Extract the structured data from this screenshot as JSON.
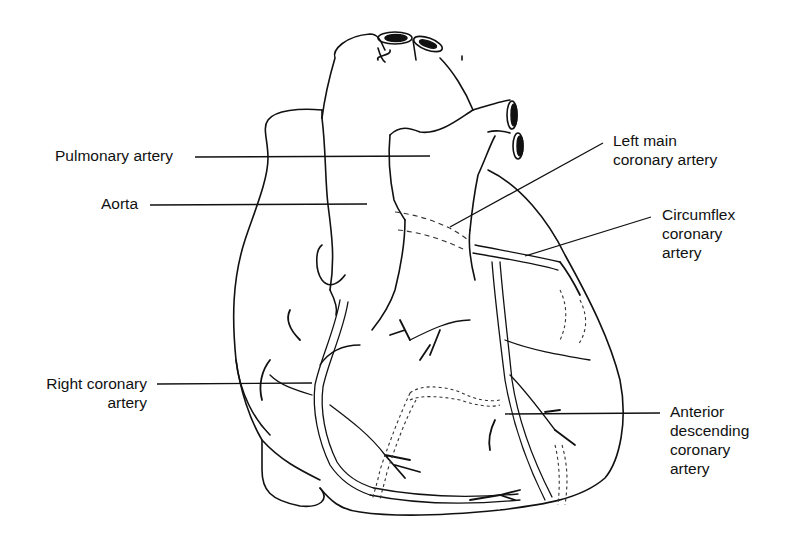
{
  "diagram": {
    "labels": [
      {
        "id": "pulmonary-artery",
        "lines": [
          "Pulmonary artery"
        ]
      },
      {
        "id": "aorta",
        "lines": [
          "Aorta"
        ]
      },
      {
        "id": "left-main-coronary-artery",
        "lines": [
          "Left main",
          "coronary artery"
        ]
      },
      {
        "id": "circumflex-coronary-artery",
        "lines": [
          "Circumflex",
          "coronary",
          "artery"
        ]
      },
      {
        "id": "right-coronary-artery",
        "lines": [
          "Right coronary",
          "artery"
        ]
      },
      {
        "id": "anterior-descending-coronary-artery",
        "lines": [
          "Anterior",
          "descending",
          "coronary",
          "artery"
        ]
      }
    ],
    "colors": {
      "ink": "#111111",
      "background": "#ffffff"
    }
  }
}
